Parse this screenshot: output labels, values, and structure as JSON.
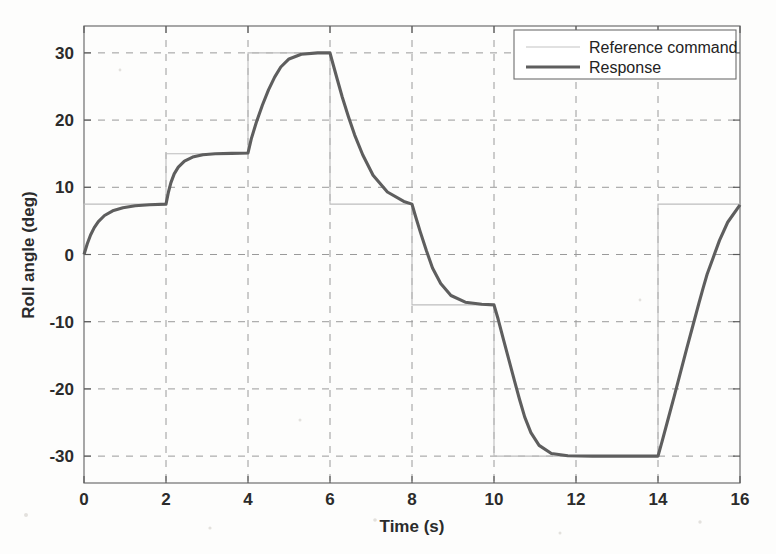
{
  "chart_data": {
    "type": "line",
    "title": "",
    "xlabel": "Time (s)",
    "ylabel": "Roll angle (deg)",
    "xlim": [
      0,
      16
    ],
    "ylim": [
      -34,
      34
    ],
    "xticks": [
      0,
      2,
      4,
      6,
      8,
      10,
      12,
      14,
      16
    ],
    "xtick_labels": [
      "0",
      "2",
      "4",
      "6",
      "8",
      "10",
      "12",
      "14",
      "16"
    ],
    "yticks": [
      -30,
      -20,
      -10,
      0,
      10,
      20,
      30
    ],
    "ytick_labels": [
      "-30",
      "-20",
      "-10",
      "0",
      "10",
      "20",
      "30"
    ],
    "grid": true,
    "legend_position": "top-right",
    "legend": [
      "Reference command",
      "Response"
    ],
    "colors": {
      "reference": "#bdbdbd",
      "response": "#5e5e5e",
      "grid": "#9a9a9a",
      "frame": "#6e6e6e",
      "background": "#fdfdfc"
    },
    "series": [
      {
        "name": "Reference command",
        "style": "thin-step",
        "description": "Staircase step command, instantaneous transitions",
        "x": [
          0,
          0,
          2,
          2,
          4,
          4,
          6,
          6,
          8,
          8,
          10,
          10,
          14,
          14,
          16
        ],
        "values": [
          0,
          7.5,
          7.5,
          15,
          15,
          30,
          30,
          7.5,
          7.5,
          -7.5,
          -7.5,
          -30,
          -30,
          7.5,
          7.5
        ]
      },
      {
        "name": "Response",
        "style": "thick-smooth",
        "description": "Closed-loop roll angle response tracking the staircase command with first-order lag and rate limiting",
        "x": [
          0,
          0.08,
          0.16,
          0.25,
          0.35,
          0.5,
          0.7,
          0.95,
          1.25,
          1.6,
          2.0,
          2.06,
          2.12,
          2.2,
          2.3,
          2.45,
          2.65,
          2.9,
          3.2,
          3.6,
          4.0,
          4.08,
          4.2,
          4.35,
          4.5,
          4.65,
          4.8,
          5.0,
          5.3,
          5.7,
          6.0,
          6.08,
          6.18,
          6.3,
          6.45,
          6.6,
          6.8,
          7.05,
          7.4,
          7.8,
          8.0,
          8.08,
          8.2,
          8.35,
          8.5,
          8.7,
          8.95,
          9.3,
          9.7,
          10.0,
          10.1,
          10.22,
          10.36,
          10.5,
          10.62,
          10.75,
          10.9,
          11.1,
          11.4,
          11.8,
          12.4,
          13.2,
          14.0,
          14.1,
          14.25,
          14.4,
          14.55,
          14.7,
          14.85,
          15.0,
          15.1,
          15.2,
          15.35,
          15.5,
          15.7,
          16.0
        ],
        "values": [
          0,
          1.6,
          2.9,
          4.0,
          4.9,
          5.8,
          6.5,
          6.95,
          7.25,
          7.4,
          7.5,
          9.3,
          10.7,
          12.0,
          13.0,
          13.9,
          14.5,
          14.85,
          15.0,
          15.05,
          15.1,
          17.2,
          19.6,
          22.2,
          24.5,
          26.4,
          27.9,
          29.1,
          29.8,
          30.0,
          30.0,
          28.2,
          26.0,
          23.4,
          20.5,
          17.8,
          14.8,
          11.8,
          9.3,
          7.9,
          7.5,
          5.8,
          3.4,
          0.6,
          -2.0,
          -4.3,
          -6.1,
          -7.1,
          -7.4,
          -7.5,
          -9.6,
          -12.4,
          -15.6,
          -18.8,
          -21.5,
          -24.2,
          -26.5,
          -28.4,
          -29.6,
          -29.95,
          -30.0,
          -30.0,
          -30.0,
          -27.8,
          -24.4,
          -21.0,
          -17.5,
          -14.0,
          -10.6,
          -7.2,
          -5.0,
          -2.9,
          -0.4,
          2.1,
          4.8,
          7.4
        ]
      }
    ]
  }
}
